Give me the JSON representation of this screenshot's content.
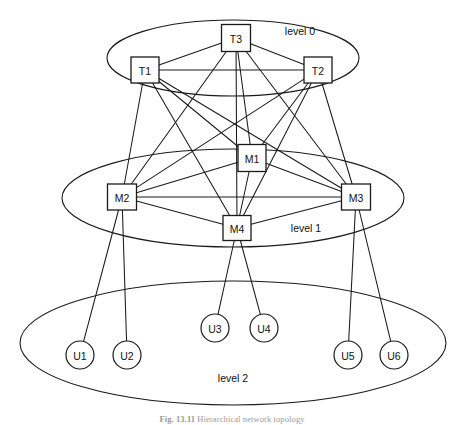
{
  "figure": {
    "caption_number": "Fig. 13.11",
    "caption_title": "Hierarchical network topology",
    "width": 464,
    "height": 425,
    "background": "#ffffff",
    "stroke_color": "#1a1a1a"
  },
  "levels": [
    {
      "id": "level-0",
      "label": "level 0",
      "label_x": 300,
      "label_y": 31,
      "ellipse": {
        "cx": 233,
        "cy": 58,
        "rx": 126,
        "ry": 38
      }
    },
    {
      "id": "level-1",
      "label": "level 1",
      "label_x": 306,
      "label_y": 228,
      "ellipse": {
        "cx": 233,
        "cy": 198,
        "rx": 171,
        "ry": 49
      }
    },
    {
      "id": "level-2",
      "label": "level 2",
      "label_x": 233,
      "label_y": 378,
      "ellipse": {
        "cx": 233,
        "cy": 343,
        "rx": 213,
        "ry": 62
      }
    }
  ],
  "nodes": [
    {
      "id": "T3",
      "label": "T3",
      "shape": "box",
      "level": "level-0",
      "x": 236,
      "y": 38,
      "w": 29,
      "h": 27
    },
    {
      "id": "T1",
      "label": "T1",
      "shape": "box",
      "level": "level-0",
      "x": 145,
      "y": 70,
      "w": 28,
      "h": 26
    },
    {
      "id": "T2",
      "label": "T2",
      "shape": "box",
      "level": "level-0",
      "x": 318,
      "y": 70,
      "w": 28,
      "h": 26
    },
    {
      "id": "M1",
      "label": "M1",
      "shape": "box",
      "level": "level-1",
      "x": 252,
      "y": 158,
      "w": 28,
      "h": 27
    },
    {
      "id": "M2",
      "label": "M2",
      "shape": "box",
      "level": "level-1",
      "x": 122,
      "y": 197,
      "w": 29,
      "h": 26
    },
    {
      "id": "M3",
      "label": "M3",
      "shape": "box",
      "level": "level-1",
      "x": 356,
      "y": 197,
      "w": 29,
      "h": 26
    },
    {
      "id": "M4",
      "label": "M4",
      "shape": "box",
      "level": "level-1",
      "x": 237,
      "y": 228,
      "w": 28,
      "h": 25
    },
    {
      "id": "U1",
      "label": "U1",
      "shape": "circle",
      "level": "level-2",
      "x": 80,
      "y": 355,
      "r": 14
    },
    {
      "id": "U2",
      "label": "U2",
      "shape": "circle",
      "level": "level-2",
      "x": 127,
      "y": 355,
      "r": 14
    },
    {
      "id": "U3",
      "label": "U3",
      "shape": "circle",
      "level": "level-2",
      "x": 215,
      "y": 328,
      "r": 14
    },
    {
      "id": "U4",
      "label": "U4",
      "shape": "circle",
      "level": "level-2",
      "x": 264,
      "y": 328,
      "r": 14
    },
    {
      "id": "U5",
      "label": "U5",
      "shape": "circle",
      "level": "level-2",
      "x": 348,
      "y": 355,
      "r": 14
    },
    {
      "id": "U6",
      "label": "U6",
      "shape": "circle",
      "level": "level-2",
      "x": 394,
      "y": 355,
      "r": 14
    }
  ],
  "edges": [
    {
      "from": "T1",
      "to": "T2"
    },
    {
      "from": "T1",
      "to": "T3"
    },
    {
      "from": "T2",
      "to": "T3"
    },
    {
      "from": "T1",
      "to": "M1"
    },
    {
      "from": "T1",
      "to": "M2"
    },
    {
      "from": "T1",
      "to": "M3"
    },
    {
      "from": "T1",
      "to": "M4"
    },
    {
      "from": "T2",
      "to": "M1"
    },
    {
      "from": "T2",
      "to": "M2"
    },
    {
      "from": "T2",
      "to": "M3"
    },
    {
      "from": "T2",
      "to": "M4"
    },
    {
      "from": "T3",
      "to": "M1"
    },
    {
      "from": "T3",
      "to": "M2"
    },
    {
      "from": "T3",
      "to": "M3"
    },
    {
      "from": "T3",
      "to": "M4"
    },
    {
      "from": "M1",
      "to": "M2"
    },
    {
      "from": "M1",
      "to": "M3"
    },
    {
      "from": "M1",
      "to": "M4"
    },
    {
      "from": "M2",
      "to": "M3"
    },
    {
      "from": "M2",
      "to": "M4"
    },
    {
      "from": "M3",
      "to": "M4"
    },
    {
      "from": "M2",
      "to": "U1"
    },
    {
      "from": "M2",
      "to": "U2"
    },
    {
      "from": "M4",
      "to": "U3"
    },
    {
      "from": "M4",
      "to": "U4"
    },
    {
      "from": "M3",
      "to": "U5"
    },
    {
      "from": "M3",
      "to": "U6"
    }
  ]
}
